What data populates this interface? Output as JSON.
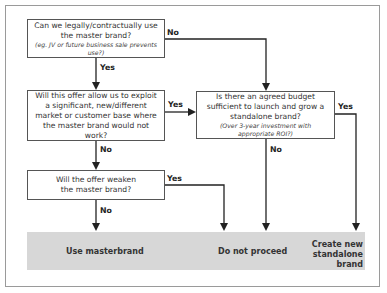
{
  "diagram": {
    "nodes": {
      "q1": {
        "question": "Can we legally/contractually use the master brand?",
        "note": "(eg. JV or future business sale prevents use?)"
      },
      "q2": {
        "question": "Will this offer allow us to exploit a significant, new/different market or customer base where the master brand would not work?"
      },
      "q3": {
        "question": "Is there an agreed budget sufficient to launch and grow a standalone brand?",
        "note": "(Over 3-year investment with appropriate ROI?)"
      },
      "q4": {
        "question": "Will the offer weaken the master brand?"
      }
    },
    "edges": {
      "q1_no": "No",
      "q1_yes": "Yes",
      "q2_yes": "Yes",
      "q2_no": "No",
      "q3_yes": "Yes",
      "q3_no": "No",
      "q4_yes": "Yes",
      "q4_no": "No"
    },
    "outcomes": {
      "use_masterbrand": "Use masterbrand",
      "do_not_proceed": "Do not proceed",
      "create_new_line1": "Create new",
      "create_new_line2": "standalone brand"
    },
    "colors": {
      "outcome_band": "#d7d7d7",
      "frame_border": "#9a9a9a",
      "lines": "#222222"
    }
  }
}
